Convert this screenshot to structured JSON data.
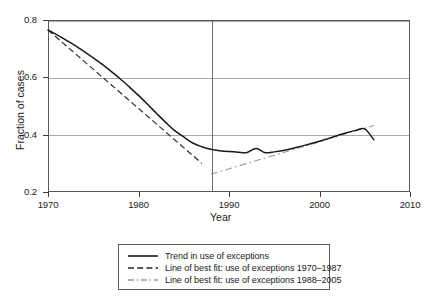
{
  "chart_data": {
    "type": "line",
    "title": "",
    "xlabel": "Year",
    "ylabel": "Fraction of cases",
    "xlim": [
      1970,
      2010
    ],
    "ylim": [
      0.2,
      0.8
    ],
    "xticks": [
      "1970",
      "1980",
      "1990",
      "2000",
      "2010"
    ],
    "xtick_values": [
      1970,
      1980,
      1990,
      2000,
      2010
    ],
    "yticks": [
      "0.2",
      "0.4",
      "0.6",
      "0.8"
    ],
    "ytick_values": [
      0.2,
      0.4,
      0.6,
      0.8
    ],
    "grid": "horizontal gridlines at 0.4, 0.6, 0.8",
    "legend_position": "below plot, centered",
    "annotations": [
      {
        "name": "vertical-reference-line",
        "x": 1988,
        "label": ""
      }
    ],
    "series": [
      {
        "name": "Trend in use of exceptions",
        "style": "solid",
        "color": "#1a1a1a",
        "x": [
          1970,
          1971,
          1972,
          1973,
          1974,
          1975,
          1976,
          1977,
          1978,
          1979,
          1980,
          1981,
          1982,
          1983,
          1984,
          1985,
          1986,
          1987,
          1988,
          1989,
          1990,
          1991,
          1992,
          1993,
          1994,
          1995,
          1996,
          1997,
          1998,
          1999,
          2000,
          2001,
          2002,
          2003,
          2004,
          2005,
          2006
        ],
        "values": [
          0.765,
          0.748,
          0.73,
          0.711,
          0.69,
          0.668,
          0.645,
          0.62,
          0.594,
          0.566,
          0.537,
          0.506,
          0.474,
          0.443,
          0.414,
          0.392,
          0.371,
          0.358,
          0.349,
          0.344,
          0.341,
          0.339,
          0.338,
          0.352,
          0.337,
          0.34,
          0.345,
          0.352,
          0.36,
          0.368,
          0.377,
          0.387,
          0.397,
          0.407,
          0.415,
          0.42,
          0.382
        ]
      },
      {
        "name": "Line of best fit: use of exceptions 1970–1987",
        "style": "dashed",
        "color": "#2b2b2b",
        "x": [
          1970,
          1987
        ],
        "values": [
          0.765,
          0.3
        ]
      },
      {
        "name": "Line of best fit: use of exceptions 1988–2005",
        "style": "dash-dot",
        "color": "#9a9a9a",
        "x": [
          1988,
          2006
        ],
        "values": [
          0.262,
          0.432
        ]
      }
    ]
  },
  "legend": {
    "entries": [
      {
        "label": "Trend in use of exceptions",
        "key": "solid-line-key"
      },
      {
        "label": "Line of best fit: use of exceptions 1970–1987",
        "key": "dashed-line-key"
      },
      {
        "label": "Line of best fit: use of exceptions 1988–2005",
        "key": "dash-dot-line-key"
      }
    ]
  }
}
